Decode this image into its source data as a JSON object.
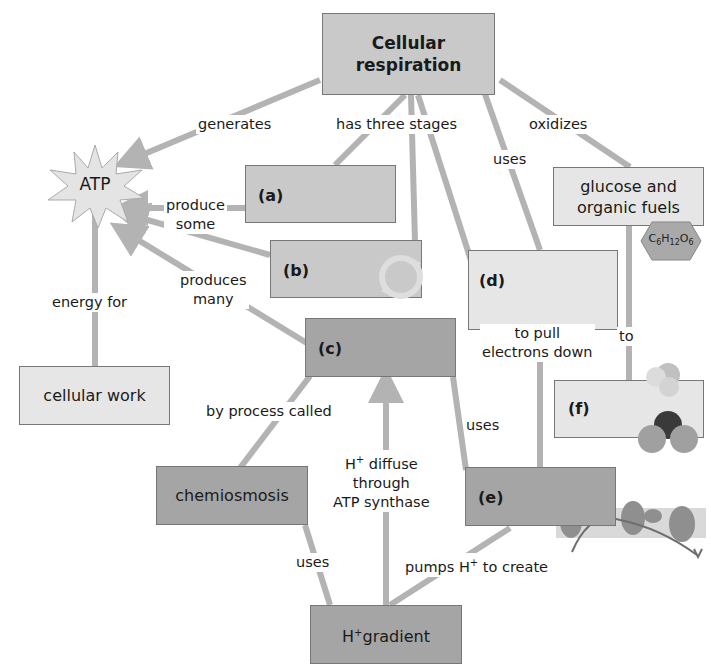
{
  "nodes": {
    "root": "Cellular respiration",
    "root_line1": "Cellular",
    "root_line2": "respiration",
    "atp": "ATP",
    "a": "(a)",
    "b": "(b)",
    "c": "(c)",
    "d": "(d)",
    "e": "(e)",
    "f": "(f)",
    "fuels_line1": "glucose and",
    "fuels_line2": "organic fuels",
    "glucose_formula": {
      "C": "C",
      "c_sub": "6",
      "H": "H",
      "h_sub": "12",
      "O": "O",
      "o_sub": "6"
    },
    "cellular_work": "cellular work",
    "chemiosmosis": "chemiosmosis",
    "gradient": {
      "prefix": "H",
      "sup": "+",
      "text": "gradient"
    }
  },
  "links": {
    "generates": "generates",
    "has_three_stages": "has three stages",
    "oxidizes": "oxidizes",
    "uses_top": "uses",
    "produce_some_1": "produce",
    "produce_some_2": "some",
    "produces_many_1": "produces",
    "produces_many_2": "many",
    "energy_for": "energy for",
    "to_pull_1": "to pull",
    "to_pull_2": "electrons down",
    "to": "to",
    "by_process_called": "by process called",
    "uses_mid": "uses",
    "h_diffuse": {
      "prefix": "H",
      "sup": "+",
      "line1": " diffuse",
      "line2": "through",
      "line3": "ATP synthase"
    },
    "uses_bottom": "uses",
    "pumps": {
      "prefix": "pumps H",
      "sup": "+",
      "suffix": " to create"
    }
  },
  "colors": {
    "line": "#b3b3b3",
    "light_box": "#e6e6e6",
    "mid_box": "#c9c9c9",
    "dark_box": "#a5a5a5",
    "border": "#777777"
  }
}
